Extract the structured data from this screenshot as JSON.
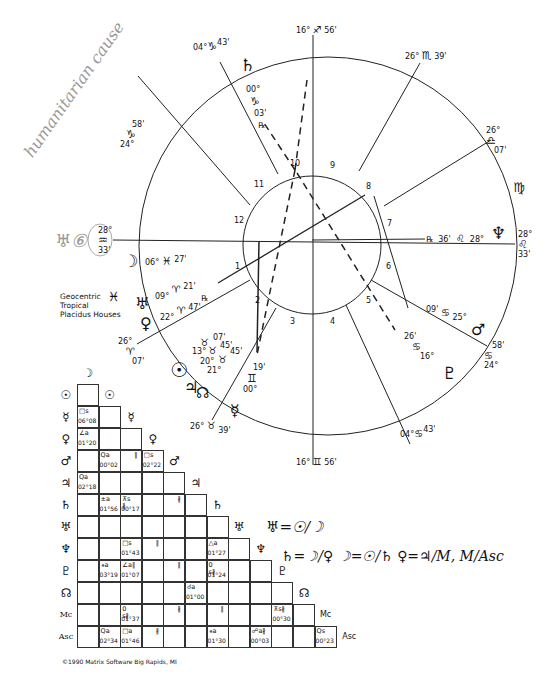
{
  "chart": {
    "info_lines": [
      "Geocentric",
      "Tropical",
      "Placidus Houses"
    ],
    "info_icon": "pisces-glyph",
    "copyright": "©1990 Matrix Software Big Rapids, MI"
  },
  "house_cusps": [
    {
      "house": "10 (MC)",
      "deg": "16°",
      "sign": "♐",
      "min": "56'"
    },
    {
      "house": "11",
      "deg": "26°",
      "sign": "♏",
      "min": "39'"
    },
    {
      "house": "12",
      "deg": "26°",
      "sign": "♎",
      "min": "07'"
    },
    {
      "house": "9",
      "deg": "04°",
      "sign": "♑",
      "min": "43'"
    },
    {
      "house": "8",
      "deg": "24°",
      "sign": "♑",
      "min": "58'"
    },
    {
      "house": "1 (Asc)",
      "deg": "28°",
      "sign": "♒",
      "min": "33'"
    },
    {
      "house": "7 (Dsc)",
      "deg": "28°",
      "sign": "♌",
      "min": "33'"
    },
    {
      "house": "2",
      "deg": "26°",
      "sign": "♈",
      "min": "07'"
    },
    {
      "house": "3",
      "deg": "26°",
      "sign": "♉",
      "min": "39'"
    },
    {
      "house": "4 (IC)",
      "deg": "16°",
      "sign": "♊",
      "min": "56'"
    },
    {
      "house": "5",
      "deg": "04°",
      "sign": "♋",
      "min": "43'"
    },
    {
      "house": "6",
      "deg": "24°",
      "sign": "♋",
      "min": "58'"
    }
  ],
  "wheel_labels": {
    "mc": {
      "deg": "16°",
      "sign": "♐",
      "min": "56'"
    },
    "cusp11": {
      "deg": "26°",
      "sign": "♏",
      "min": "39'"
    },
    "cusp12": {
      "deg": "26°",
      "sign": "♎",
      "min": "07'"
    },
    "virgo": "♍",
    "dsc": {
      "deg": "28°",
      "sign": "♌",
      "min": "33'"
    },
    "cusp6": {
      "deg": "24°",
      "sign": "♋",
      "min": "58'"
    },
    "cusp5": {
      "deg": "04°",
      "sign": "♋",
      "min": "43'"
    },
    "ic": {
      "deg": "16°",
      "sign": "♊",
      "min": "56'"
    },
    "cusp3": {
      "deg": "26°",
      "sign": "♉",
      "min": "39'"
    },
    "cusp2": {
      "deg": "26°",
      "sign": "♈",
      "min": "07'"
    },
    "asc": {
      "deg": "28°",
      "sign": "♒",
      "min": "33'"
    },
    "cusp9": {
      "deg": "04°",
      "sign": "♑",
      "min": "43'"
    },
    "cusp8": {
      "deg": "24°",
      "sign": "♑",
      "min": "58'"
    }
  },
  "house_numbers": [
    "1",
    "2",
    "3",
    "4",
    "5",
    "6",
    "7",
    "8",
    "9",
    "10",
    "11",
    "12"
  ],
  "planets": {
    "saturn": {
      "glyph": "♄",
      "deg": "00°",
      "sign": "♑",
      "min": "03'",
      "retro": "℞"
    },
    "neptune": {
      "glyph": "♆",
      "deg": "28°",
      "sign": "♌",
      "min": "36'",
      "retro": "℞"
    },
    "mars": {
      "glyph": "♂",
      "deg": "25°",
      "sign": "♋",
      "min": "09'"
    },
    "pluto": {
      "glyph": "♇",
      "deg": "16°",
      "sign": "♋",
      "min": "26'"
    },
    "moon": {
      "glyph": "☽",
      "deg": "06°",
      "sign": "♓",
      "min": "27'"
    },
    "uranus": {
      "glyph": "♅",
      "deg": "09°",
      "sign": "♈",
      "min": "21'",
      "retro": "℞"
    },
    "venus": {
      "glyph": "♀",
      "deg": "22°",
      "sign": "♈",
      "min": "47'"
    },
    "sun": {
      "glyph": "☉",
      "deg": "13°",
      "sign": "♉",
      "min": "07'"
    },
    "jupiter": {
      "glyph": "♃",
      "deg": "20°",
      "sign": "♉",
      "min": "45'"
    },
    "node": {
      "glyph": "☊",
      "deg": "21°",
      "sign": "♉",
      "min": "45'"
    },
    "mercury": {
      "glyph": "☿",
      "deg": "00°",
      "sign": "♊",
      "min": "19'"
    }
  },
  "aspect_grid": {
    "row_labels": [
      "☉",
      "☿",
      "♀",
      "♂",
      "♃",
      "♄",
      "♅",
      "♆",
      "♇",
      "☊",
      "Mc",
      "Asc"
    ],
    "col_labels": [
      "☽",
      "☉",
      "☿",
      "♀",
      "♂",
      "♃",
      "♄",
      "♅",
      "♆",
      "♇",
      "☊",
      "Mc"
    ],
    "cells": [
      {
        "row": 1,
        "col": 0,
        "aspect": "□s",
        "orb": "06°08"
      },
      {
        "row": 2,
        "col": 0,
        "aspect": "∠a",
        "orb": "01°20"
      },
      {
        "row": 3,
        "col": 1,
        "aspect": "Qa",
        "orb": "00°02"
      },
      {
        "row": 3,
        "col": 2,
        "parallel": "∥"
      },
      {
        "row": 3,
        "col": 3,
        "aspect": "□s",
        "orb": "02°22"
      },
      {
        "row": 4,
        "col": 0,
        "aspect": "Qa",
        "orb": "02°18"
      },
      {
        "row": 5,
        "col": 1,
        "aspect": "±a",
        "orb": "01°56"
      },
      {
        "row": 5,
        "col": 2,
        "aspect": "⊼s ∦",
        "orb": "00°17"
      },
      {
        "row": 5,
        "col": 4,
        "parallel": "∦"
      },
      {
        "row": 7,
        "col": 2,
        "aspect": "□s",
        "orb": "01°43"
      },
      {
        "row": 7,
        "col": 3,
        "parallel": "∥"
      },
      {
        "row": 7,
        "col": 6,
        "aspect": "△a",
        "orb": "01°27"
      },
      {
        "row": 8,
        "col": 1,
        "aspect": "⚹a",
        "orb": "03°19"
      },
      {
        "row": 8,
        "col": 2,
        "aspect": "∠a∥",
        "orb": "01°07"
      },
      {
        "row": 8,
        "col": 4,
        "parallel": "∥"
      },
      {
        "row": 8,
        "col": 6,
        "aspect": "0 s∦",
        "orb": "01°24"
      },
      {
        "row": 9,
        "col": 5,
        "aspect": "☌a",
        "orb": "01°00"
      },
      {
        "row": 10,
        "col": 2,
        "aspect": "0 s∦",
        "orb": "01°37"
      },
      {
        "row": 10,
        "col": 4,
        "parallel": "∦"
      },
      {
        "row": 10,
        "col": 6,
        "parallel": "∥"
      },
      {
        "row": 10,
        "col": 9,
        "aspect": "⊼s∦",
        "orb": "00°30"
      },
      {
        "row": 11,
        "col": 1,
        "aspect": "Qa",
        "orb": "02°34"
      },
      {
        "row": 11,
        "col": 2,
        "aspect": "□a",
        "orb": "01°46"
      },
      {
        "row": 11,
        "col": 3,
        "parallel": "∦"
      },
      {
        "row": 11,
        "col": 6,
        "aspect": "⚹a",
        "orb": "01°30"
      },
      {
        "row": 11,
        "col": 8,
        "aspect": "☍a∦",
        "orb": "00°03"
      },
      {
        "row": 11,
        "col": 11,
        "aspect": "Qs",
        "orb": "00°23"
      }
    ]
  },
  "annotations": {
    "handwritten_pencil": "humanitarian cause",
    "handwritten_pencil_mark": "♅⑥",
    "handwritten_ink_line1": "♅=☉/☽",
    "handwritten_ink_line2": "♄=☽/♀   ☽=☉/♄   ♀=♃/M, M/Asc"
  }
}
